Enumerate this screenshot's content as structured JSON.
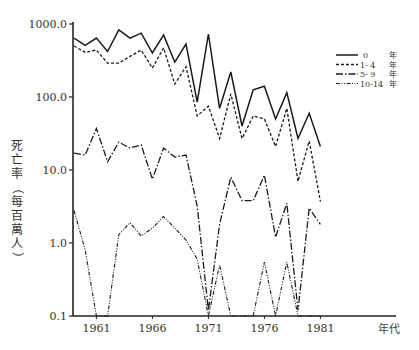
{
  "chart_data": {
    "type": "line",
    "title": "",
    "xlabel": "年代",
    "ylabel": "死亡率（每百萬人）",
    "yscale": "log",
    "ylim": [
      0.1,
      1000
    ],
    "y_ticks": [
      "1000.0",
      "100.0",
      "10.0",
      "1.0",
      "0.1"
    ],
    "y_tick_values": [
      1000,
      100,
      10,
      1,
      0.1
    ],
    "x_ticks": [
      "1961",
      "1966",
      "1971",
      "1976",
      "1981"
    ],
    "x_tick_values": [
      1961,
      1966,
      1971,
      1976,
      1981
    ],
    "xlim": [
      1959,
      1986
    ],
    "grid": false,
    "legend_position": "upper right",
    "x": [
      1959,
      1960,
      1961,
      1962,
      1963,
      1964,
      1965,
      1966,
      1967,
      1968,
      1969,
      1970,
      1971,
      1972,
      1973,
      1974,
      1975,
      1976,
      1977,
      1978,
      1979,
      1980,
      1981,
      1982
    ],
    "series": [
      {
        "name": "0 年",
        "label_age": "0",
        "label_unit": "年",
        "style": "solid",
        "values": [
          640,
          510,
          640,
          420,
          830,
          640,
          750,
          400,
          710,
          300,
          530,
          85,
          730,
          70,
          220,
          40,
          125,
          140,
          50,
          115,
          27,
          60,
          21,
          null
        ]
      },
      {
        "name": "1- 4 年",
        "label_age": "1- 4",
        "label_unit": "年",
        "style": "dashed",
        "values": [
          500,
          410,
          440,
          290,
          290,
          360,
          440,
          250,
          470,
          150,
          260,
          55,
          75,
          27,
          110,
          27,
          55,
          50,
          21,
          70,
          7,
          25,
          3.7,
          null
        ]
      },
      {
        "name": "5- 9 年",
        "label_age": "5- 9",
        "label_unit": "年",
        "style": "dashdot",
        "values": [
          17,
          16,
          37,
          13,
          24,
          20,
          22,
          7.5,
          20,
          15,
          16,
          3.2,
          0.12,
          1.8,
          8,
          3.8,
          3.8,
          8.5,
          1.2,
          3.5,
          0.12,
          3,
          1.8,
          null
        ]
      },
      {
        "name": "10-14 年",
        "label_age": "10-14",
        "label_unit": "年",
        "style": "dashdotdot",
        "values": [
          2.8,
          0.8,
          0.1,
          0.1,
          1.3,
          1.9,
          1.25,
          1.6,
          2.3,
          1.6,
          1.1,
          0.6,
          0.1,
          0.5,
          0.1,
          0.1,
          0.1,
          0.55,
          0.1,
          0.55,
          0.1,
          0.1,
          0.1,
          null
        ]
      }
    ]
  }
}
